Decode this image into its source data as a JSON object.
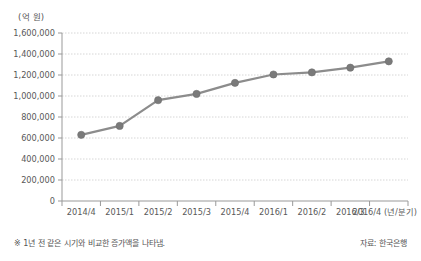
{
  "chart_data": {
    "type": "line",
    "title": "",
    "subtitle": "",
    "unit_label": "(억 원)",
    "xlabel": "(년/분기)",
    "ylabel": "",
    "categories": [
      "2014/4",
      "2015/1",
      "2015/2",
      "2015/3",
      "2015/4",
      "2016/1",
      "2016/2",
      "2016/3",
      "2016/4"
    ],
    "values": [
      630000,
      715000,
      960000,
      1020000,
      1125000,
      1205000,
      1225000,
      1270000,
      1330000
    ],
    "series": [
      {
        "name": "증가액",
        "values": [
          630000,
          715000,
          960000,
          1020000,
          1125000,
          1205000,
          1225000,
          1270000,
          1330000
        ]
      }
    ],
    "ylim": [
      0,
      1600000
    ],
    "ytick_labels": [
      "0",
      "200,000",
      "400,000",
      "600,000",
      "800,000",
      "1,000,000",
      "1,200,000",
      "1,400,000",
      "1,600,000"
    ],
    "ytick_values": [
      0,
      200000,
      400000,
      600000,
      800000,
      1000000,
      1200000,
      1400000,
      1600000
    ],
    "grid": true,
    "legend": "none",
    "line_color": "#8c8c8c",
    "marker_color": "#7a7a7a",
    "grid_color": "#cccccc",
    "axis_color": "#999999"
  },
  "footer": {
    "note": "※ 1년 전 같은 시기와 비교한 증가액을 나타냄.",
    "source": "자료: 한국은행"
  }
}
